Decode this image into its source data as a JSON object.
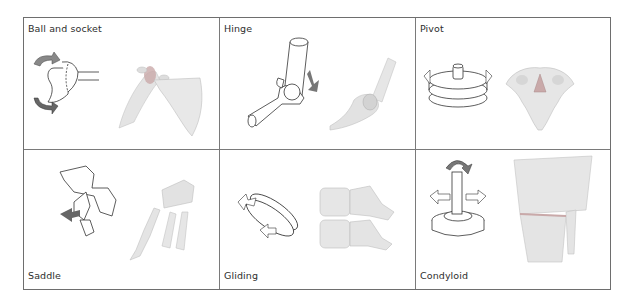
{
  "figure": {
    "panels": [
      {
        "id": "ball-and-socket",
        "label": "Ball and socket",
        "example": "shoulder",
        "label_position": "top"
      },
      {
        "id": "hinge",
        "label": "Hinge",
        "example": "elbow",
        "label_position": "top"
      },
      {
        "id": "pivot",
        "label": "Pivot",
        "example": "atlas-axis vertebra",
        "label_position": "top"
      },
      {
        "id": "saddle",
        "label": "Saddle",
        "example": "thumb carpometacarpal",
        "label_position": "bottom"
      },
      {
        "id": "gliding",
        "label": "Gliding",
        "example": "vertebral facets",
        "label_position": "bottom"
      },
      {
        "id": "condyloid",
        "label": "Condyloid",
        "example": "wrist",
        "label_position": "bottom"
      }
    ]
  },
  "colors": {
    "border": "#6e6e6e",
    "text": "#2e2e2e",
    "bone": "#e6e6e6",
    "bone_shade": "#bdbdbd",
    "arrow": "#777777",
    "cartilage": "#c9a9a9"
  }
}
